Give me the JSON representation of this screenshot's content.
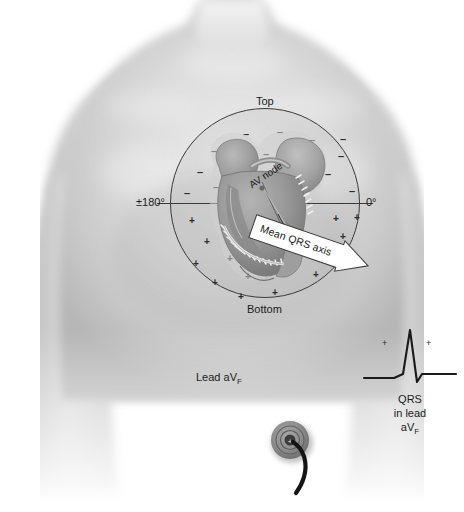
{
  "axis_circle": {
    "labels": {
      "top": "Top",
      "bottom": "Bottom",
      "left_degrees": "±180°",
      "right_degrees": "0°"
    },
    "upper_half_polarity": "negative",
    "lower_half_polarity": "positive",
    "upper_glyph": "–",
    "lower_glyph": "+"
  },
  "heart": {
    "av_node_label": "AV node",
    "mean_axis_label": "Mean QRS axis"
  },
  "lead": {
    "name_label": "Lead aV",
    "name_subscript": "F"
  },
  "ecg": {
    "caption_line1": "QRS",
    "caption_line2": "in lead",
    "caption_line3": "aV",
    "caption_subscript": "F",
    "polarity_marks": [
      "+",
      "+"
    ],
    "waveform": "tall upright R wave with small terminal S wave"
  },
  "electrode": {
    "name": "skin electrode with lead wire",
    "polarity_mark": "+"
  },
  "colors": {
    "background": "#ffffff",
    "skin_light": "#e3e3e3",
    "skin_mid": "#c9c9c9",
    "skin_shadow": "#b0b0b0",
    "circle_stroke": "#3a3a3a",
    "heart_fill": "#9a9a9a",
    "heart_dark": "#6f6f6f",
    "text": "#1b1b1b",
    "banner_fill": "#ffffff",
    "trace": "#1a1a1a"
  },
  "glyphs_upper": [
    {
      "x": 243,
      "y": 130
    },
    {
      "x": 277,
      "y": 128
    },
    {
      "x": 309,
      "y": 136
    },
    {
      "x": 211,
      "y": 147
    },
    {
      "x": 338,
      "y": 152
    },
    {
      "x": 197,
      "y": 168
    },
    {
      "x": 230,
      "y": 157
    },
    {
      "x": 263,
      "y": 150
    },
    {
      "x": 296,
      "y": 153
    },
    {
      "x": 325,
      "y": 170
    },
    {
      "x": 184,
      "y": 189
    },
    {
      "x": 349,
      "y": 187
    },
    {
      "x": 213,
      "y": 183
    },
    {
      "x": 340,
      "y": 135
    }
  ],
  "glyphs_lower": [
    {
      "x": 189,
      "y": 216
    },
    {
      "x": 221,
      "y": 212
    },
    {
      "x": 333,
      "y": 214
    },
    {
      "x": 354,
      "y": 213
    },
    {
      "x": 204,
      "y": 237
    },
    {
      "x": 238,
      "y": 230
    },
    {
      "x": 340,
      "y": 232
    },
    {
      "x": 193,
      "y": 259
    },
    {
      "x": 227,
      "y": 254
    },
    {
      "x": 260,
      "y": 249
    },
    {
      "x": 330,
      "y": 253
    },
    {
      "x": 212,
      "y": 278
    },
    {
      "x": 245,
      "y": 272
    },
    {
      "x": 281,
      "y": 270
    },
    {
      "x": 313,
      "y": 270
    },
    {
      "x": 238,
      "y": 292
    },
    {
      "x": 272,
      "y": 288
    },
    {
      "x": 300,
      "y": 247
    }
  ]
}
